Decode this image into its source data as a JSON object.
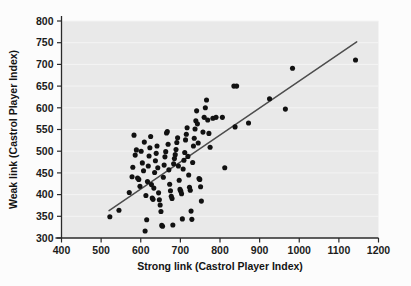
{
  "chart_data": {
    "type": "scatter",
    "title": "",
    "xlabel": "Strong link (Castrol Player Index)",
    "ylabel": "Weak link (Castrol Player Index)",
    "xlim": [
      400,
      1200
    ],
    "ylim": [
      300,
      800
    ],
    "xticks": [
      400,
      500,
      600,
      700,
      800,
      900,
      1000,
      1100,
      1200
    ],
    "yticks": [
      300,
      350,
      400,
      450,
      500,
      550,
      600,
      650,
      700,
      750,
      800
    ],
    "grid": "horizontal",
    "legend": "none",
    "plot_background_color": "#e9e9e9",
    "marker_color": "#111111",
    "trendline": {
      "color": "#4d4d4d",
      "x_start": 520,
      "y_start": 363,
      "x_end": 1145,
      "y_end": 752
    },
    "points": [
      [
        522,
        349
      ],
      [
        545,
        364
      ],
      [
        571,
        405
      ],
      [
        578,
        441
      ],
      [
        580,
        463
      ],
      [
        583,
        537
      ],
      [
        586,
        491
      ],
      [
        589,
        503
      ],
      [
        592,
        438
      ],
      [
        595,
        435
      ],
      [
        598,
        419
      ],
      [
        601,
        500
      ],
      [
        604,
        473
      ],
      [
        607,
        455
      ],
      [
        609,
        521
      ],
      [
        611,
        316
      ],
      [
        613,
        398
      ],
      [
        615,
        342
      ],
      [
        617,
        430
      ],
      [
        619,
        466
      ],
      [
        621,
        489
      ],
      [
        623,
        508
      ],
      [
        625,
        534
      ],
      [
        627,
        423
      ],
      [
        629,
        392
      ],
      [
        631,
        389
      ],
      [
        633,
        415
      ],
      [
        635,
        451
      ],
      [
        637,
        478
      ],
      [
        639,
        495
      ],
      [
        641,
        512
      ],
      [
        643,
        462
      ],
      [
        645,
        404
      ],
      [
        647,
        388
      ],
      [
        649,
        376
      ],
      [
        651,
        361
      ],
      [
        653,
        329
      ],
      [
        655,
        327
      ],
      [
        657,
        440
      ],
      [
        659,
        468
      ],
      [
        661,
        487
      ],
      [
        663,
        499
      ],
      [
        665,
        542
      ],
      [
        667,
        545
      ],
      [
        669,
        516
      ],
      [
        671,
        457
      ],
      [
        673,
        424
      ],
      [
        675,
        409
      ],
      [
        677,
        396
      ],
      [
        679,
        391
      ],
      [
        681,
        330
      ],
      [
        683,
        471
      ],
      [
        685,
        483
      ],
      [
        687,
        492
      ],
      [
        689,
        504
      ],
      [
        691,
        520
      ],
      [
        693,
        531
      ],
      [
        695,
        466
      ],
      [
        697,
        433
      ],
      [
        699,
        412
      ],
      [
        701,
        408
      ],
      [
        703,
        402
      ],
      [
        705,
        344
      ],
      [
        707,
        459
      ],
      [
        709,
        479
      ],
      [
        711,
        497
      ],
      [
        713,
        526
      ],
      [
        715,
        539
      ],
      [
        717,
        554
      ],
      [
        719,
        488
      ],
      [
        721,
        445
      ],
      [
        723,
        417
      ],
      [
        725,
        410
      ],
      [
        727,
        362
      ],
      [
        729,
        343
      ],
      [
        731,
        474
      ],
      [
        733,
        512
      ],
      [
        735,
        530
      ],
      [
        737,
        551
      ],
      [
        739,
        570
      ],
      [
        741,
        593
      ],
      [
        743,
        563
      ],
      [
        745,
        519
      ],
      [
        747,
        437
      ],
      [
        749,
        435
      ],
      [
        751,
        418
      ],
      [
        753,
        385
      ],
      [
        757,
        544
      ],
      [
        760,
        578
      ],
      [
        763,
        600
      ],
      [
        766,
        618
      ],
      [
        769,
        572
      ],
      [
        772,
        541
      ],
      [
        775,
        509
      ],
      [
        782,
        576
      ],
      [
        790,
        578
      ],
      [
        806,
        578
      ],
      [
        812,
        462
      ],
      [
        835,
        650
      ],
      [
        842,
        650
      ],
      [
        838,
        556
      ],
      [
        872,
        565
      ],
      [
        925,
        621
      ],
      [
        965,
        597
      ],
      [
        983,
        691
      ],
      [
        1142,
        710
      ]
    ],
    "n_points": 106
  }
}
